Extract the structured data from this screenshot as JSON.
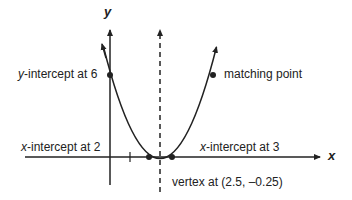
{
  "diagram": {
    "type": "parabola-graph",
    "function": "y = x^2 - 5x + 6",
    "axes": {
      "x_label": "x",
      "y_label": "y"
    },
    "annotations": {
      "y_intercept": {
        "var": "y",
        "text": "-intercept at 6"
      },
      "matching_point": {
        "text": "matching point"
      },
      "x_intercept_left": {
        "var": "x",
        "text": "-intercept at 2"
      },
      "x_intercept_right": {
        "var": "x",
        "text": "-intercept at 3"
      },
      "vertex": {
        "text": "vertex at (2.5, –0.25)"
      }
    },
    "points": [
      {
        "name": "y-intercept",
        "x": 0,
        "y": 6
      },
      {
        "name": "matching point",
        "x": 5,
        "y": 6
      },
      {
        "name": "x-intercept",
        "x": 2,
        "y": 0
      },
      {
        "name": "x-intercept",
        "x": 3,
        "y": 0
      },
      {
        "name": "vertex",
        "x": 2.5,
        "y": -0.25
      }
    ],
    "axis_of_symmetry": "x = 2.5 (dashed)",
    "colors": {
      "ink": "#222222",
      "background": "#ffffff"
    }
  }
}
